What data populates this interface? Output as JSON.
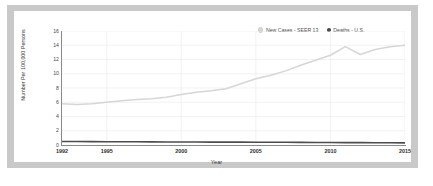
{
  "figure": {
    "background": "#ffffff",
    "frame_color": "#c9c9c9",
    "panel_color": "#ffffff"
  },
  "legend": {
    "position": "top-right",
    "entries": [
      {
        "label": "New Cases - SEER 13",
        "color": "#d6d6d6",
        "marker": "circle-open"
      },
      {
        "label": "Deaths - U.S.",
        "color": "#4d4d4d",
        "marker": "circle-filled"
      }
    ]
  },
  "axes": {
    "ylabel": "Number Per 100,000 Persons",
    "xlabel": "Year",
    "yticks": [
      "16",
      "14",
      "12",
      "10",
      "8",
      "6",
      "4",
      "2",
      "0"
    ],
    "xticks": [
      "1992",
      "1995",
      "2000",
      "2005",
      "2010",
      "2015"
    ]
  },
  "chart_data": {
    "type": "line",
    "title": "",
    "xlabel": "Year",
    "ylabel": "Number Per 100,000 Persons",
    "xlim": [
      1992,
      2015
    ],
    "ylim": [
      0,
      16
    ],
    "grid": true,
    "legend_position": "top-right",
    "x": [
      1992,
      1993,
      1994,
      1995,
      1996,
      1997,
      1998,
      1999,
      2000,
      2001,
      2002,
      2003,
      2004,
      2005,
      2006,
      2007,
      2008,
      2009,
      2010,
      2011,
      2012,
      2013,
      2014,
      2015
    ],
    "xtick_values": [
      1992,
      1995,
      2000,
      2005,
      2010,
      2015
    ],
    "xtick_labels": [
      "1992",
      "1995",
      "2000",
      "2005",
      "2010",
      "2015"
    ],
    "ytick_values": [
      0,
      2,
      4,
      6,
      8,
      10,
      12,
      14,
      16
    ],
    "ytick_labels": [
      "0",
      "2",
      "4",
      "6",
      "8",
      "10",
      "12",
      "14",
      "16"
    ],
    "series": [
      {
        "name": "New Cases - SEER 13",
        "color": "#d6d6d6",
        "values": [
          5.8,
          5.7,
          5.8,
          6.0,
          6.2,
          6.4,
          6.5,
          6.7,
          7.1,
          7.4,
          7.6,
          7.9,
          8.6,
          9.3,
          9.8,
          10.4,
          11.2,
          11.9,
          12.6,
          13.8,
          12.7,
          13.4,
          13.8,
          14.0
        ]
      },
      {
        "name": "Deaths - U.S.",
        "color": "#4d4d4d",
        "values": [
          0.5,
          0.5,
          0.48,
          0.46,
          0.45,
          0.45,
          0.44,
          0.43,
          0.42,
          0.42,
          0.41,
          0.4,
          0.4,
          0.39,
          0.38,
          0.38,
          0.37,
          0.36,
          0.35,
          0.34,
          0.33,
          0.32,
          0.31,
          0.3
        ]
      }
    ]
  }
}
